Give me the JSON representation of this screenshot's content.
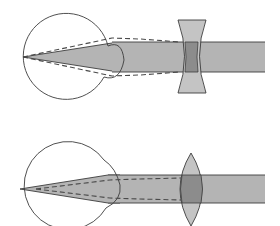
{
  "diagram": {
    "panels": [
      {
        "id": "myopia-correction",
        "description": "Eye with concave (diverging) corrective lens",
        "lens_type": "concave",
        "eye": {
          "cx": 66,
          "cy": 57,
          "r": 43
        },
        "beam": {
          "x1": 100,
          "x2": 265,
          "y1": 42,
          "y2": 72
        },
        "lens": {
          "x_left": 178,
          "x_right": 206,
          "y_top": 20,
          "y_bottom": 93,
          "waist_left": 186,
          "waist_right": 197
        },
        "focus": {
          "x": 23,
          "y": 57
        }
      },
      {
        "id": "hyperopia-correction",
        "description": "Eye with convex (converging) corrective lens",
        "lens_type": "convex",
        "eye": {
          "cx": 75,
          "cy": 177,
          "r": 44
        },
        "beam": {
          "x1": 100,
          "x2": 265,
          "y1": 175,
          "y2": 203
        },
        "lens": {
          "cx": 191,
          "y_top": 153,
          "y_bottom": 226,
          "half_width": 11
        },
        "focus": {
          "x": 20,
          "y": 189
        }
      }
    ],
    "colors": {
      "beam_fill": "#b4b4b4",
      "lens_fill": "#c4c4c4",
      "overlap_fill": "#8c8c8c",
      "stroke": "#3c3c3c",
      "dashed": "#4a4a4a",
      "background": "#ffffff"
    }
  }
}
